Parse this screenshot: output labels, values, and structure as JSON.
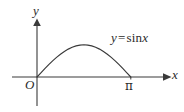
{
  "figure": {
    "type": "math-graph",
    "background_color": "#ffffff",
    "stroke_color": "#3a3a3a",
    "labels": {
      "y_axis": "y",
      "x_axis": "x",
      "origin": "O",
      "pi_tick": "π",
      "curve_equation_lhs": "y",
      "curve_equation_operator": "=",
      "curve_equation_rhs_function": "sin",
      "curve_equation_rhs_variable": "x",
      "curve_equation_full": "y = sin x"
    }
  },
  "chart_data": {
    "type": "line",
    "title": "",
    "xlabel": "x",
    "ylabel": "y",
    "legend": [
      "y = sin x"
    ],
    "legend_position": "inline-right",
    "grid": false,
    "xlim": [
      -0.55,
      3.95
    ],
    "ylim": [
      -0.65,
      1.45
    ],
    "xticks": [
      0,
      3.14159
    ],
    "xticklabels": [
      "O",
      "π"
    ],
    "yticks": [],
    "yticklabels": [],
    "annotations": [
      {
        "text": "y = sin x",
        "x": 2.45,
        "y": 0.95
      },
      {
        "text": "O",
        "x": -0.25,
        "y": -0.17
      },
      {
        "text": "π",
        "x": 3.14159,
        "y": -0.21
      },
      {
        "text": "y",
        "x": -0.05,
        "y": 1.38
      },
      {
        "text": "x",
        "x": 3.85,
        "y": 0.13
      }
    ],
    "series": [
      {
        "name": "y = sin x",
        "x": [
          0,
          0.1309,
          0.2618,
          0.3927,
          0.5236,
          0.6545,
          0.7854,
          0.9163,
          1.0472,
          1.1781,
          1.309,
          1.4399,
          1.5708,
          1.7017,
          1.8326,
          1.9635,
          2.0944,
          2.2253,
          2.3562,
          2.4871,
          2.618,
          2.7489,
          2.8798,
          3.0107,
          3.14159
        ],
        "y": [
          0,
          0.1305,
          0.2588,
          0.3827,
          0.5,
          0.6088,
          0.7071,
          0.7934,
          0.866,
          0.9239,
          0.9659,
          0.9914,
          1,
          0.9914,
          0.9659,
          0.9239,
          0.866,
          0.7934,
          0.7071,
          0.6088,
          0.5,
          0.3827,
          0.2588,
          0.1305,
          0
        ]
      }
    ]
  }
}
